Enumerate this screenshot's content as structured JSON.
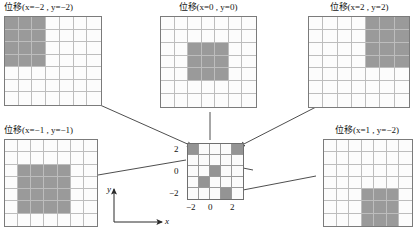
{
  "figure": {
    "caption_prefix": "位移",
    "dark_color": "#9a9a9a",
    "light_color": "#fcfcfc",
    "line_color": "#333333"
  },
  "panels": [
    {
      "id": "top-left",
      "title": "位移(x=−2 , y=−2)",
      "title_cn": "位移",
      "shift_x": -2,
      "shift_y": -2,
      "rows": 7,
      "cols": 7,
      "dark_cells": [
        [
          1,
          1
        ],
        [
          1,
          2
        ],
        [
          1,
          3
        ],
        [
          2,
          1
        ],
        [
          2,
          2
        ],
        [
          2,
          3
        ],
        [
          3,
          1
        ],
        [
          3,
          2
        ],
        [
          3,
          3
        ],
        [
          4,
          1
        ],
        [
          4,
          2
        ],
        [
          4,
          3
        ]
      ]
    },
    {
      "id": "top-center",
      "title": "位移(x=0 , y=0)",
      "title_cn": "位移",
      "shift_x": 0,
      "shift_y": 0,
      "rows": 7,
      "cols": 7,
      "dark_cells": [
        [
          3,
          3
        ],
        [
          3,
          4
        ],
        [
          3,
          5
        ],
        [
          4,
          3
        ],
        [
          4,
          4
        ],
        [
          4,
          5
        ],
        [
          5,
          3
        ],
        [
          5,
          4
        ],
        [
          5,
          5
        ]
      ]
    },
    {
      "id": "top-right",
      "title": "位移(x=2 , y=2)",
      "title_cn": "位移",
      "shift_x": 2,
      "shift_y": 2,
      "rows": 7,
      "cols": 7,
      "dark_cells": [
        [
          1,
          5
        ],
        [
          1,
          6
        ],
        [
          1,
          7
        ],
        [
          2,
          5
        ],
        [
          2,
          6
        ],
        [
          2,
          7
        ],
        [
          3,
          5
        ],
        [
          3,
          6
        ],
        [
          3,
          7
        ],
        [
          4,
          5
        ],
        [
          4,
          6
        ],
        [
          4,
          7
        ]
      ]
    },
    {
      "id": "bottom-left",
      "title": "位移(x=−1 , y=−1)",
      "title_cn": "位移",
      "shift_x": -1,
      "shift_y": -1,
      "rows": 7,
      "cols": 7,
      "dark_cells": [
        [
          3,
          2
        ],
        [
          3,
          3
        ],
        [
          3,
          4
        ],
        [
          3,
          5
        ],
        [
          4,
          2
        ],
        [
          4,
          3
        ],
        [
          4,
          4
        ],
        [
          4,
          5
        ],
        [
          5,
          2
        ],
        [
          5,
          3
        ],
        [
          5,
          4
        ],
        [
          5,
          5
        ],
        [
          6,
          2
        ],
        [
          6,
          3
        ],
        [
          6,
          4
        ],
        [
          6,
          5
        ]
      ]
    },
    {
      "id": "bottom-right",
      "title": "位移(x=1 , y=−2)",
      "title_cn": "位移",
      "shift_x": 1,
      "shift_y": -2,
      "rows": 7,
      "cols": 7,
      "dark_cells": [
        [
          5,
          4
        ],
        [
          5,
          5
        ],
        [
          5,
          6
        ],
        [
          6,
          4
        ],
        [
          6,
          5
        ],
        [
          6,
          6
        ],
        [
          7,
          4
        ],
        [
          7,
          5
        ],
        [
          7,
          6
        ]
      ]
    }
  ],
  "center": {
    "id": "center-source",
    "rows": 5,
    "cols": 5,
    "dark_cells": [
      [
        1,
        1
      ],
      [
        1,
        5
      ],
      [
        3,
        3
      ],
      [
        4,
        2
      ],
      [
        5,
        4
      ]
    ],
    "y_ticks": [
      "2",
      "0",
      "−2"
    ],
    "x_ticks": [
      "−2",
      "0",
      "2"
    ]
  },
  "axes_key": {
    "x_label": "x",
    "y_label": "y"
  }
}
